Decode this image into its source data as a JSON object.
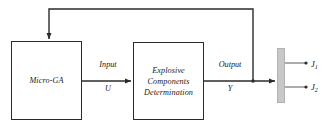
{
  "diagram": {
    "type": "block-diagram",
    "background_color": "#ffffff",
    "line_color": "#2b2b2b",
    "blocks": [
      {
        "id": "micro-ga",
        "label": "Micro-GA"
      },
      {
        "id": "explosive-components",
        "label": "Explosive\nComponents\nDetermination"
      }
    ],
    "signals": {
      "input_label": "Input",
      "input_variable": "U",
      "output_label": "Output",
      "output_variable": "Y"
    },
    "plant": {
      "id": "evaluation-bar",
      "fill_color": "#c8c8c8",
      "border_color": "#b2b2b2"
    },
    "objectives": [
      {
        "name": "J",
        "subscript": "1"
      },
      {
        "name": "J",
        "subscript": "2"
      }
    ],
    "connections": [
      {
        "from": "micro-ga",
        "to": "explosive-components",
        "label": "Input U"
      },
      {
        "from": "explosive-components",
        "to": "evaluation-bar",
        "label": "Output Y"
      },
      {
        "from": "evaluation-bar",
        "to": "micro-ga",
        "label": "feedback"
      },
      {
        "from": "evaluation-bar",
        "to": "J1",
        "label": ""
      },
      {
        "from": "evaluation-bar",
        "to": "J2",
        "label": ""
      }
    ]
  }
}
